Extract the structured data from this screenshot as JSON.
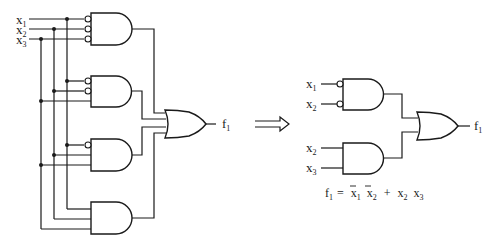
{
  "left_circuit": {
    "inputs": [
      {
        "name": "x",
        "sub": "1"
      },
      {
        "name": "x",
        "sub": "2"
      },
      {
        "name": "x",
        "sub": "3"
      }
    ],
    "gates": [
      {
        "type": "AND",
        "inputs": [
          "x1'",
          "x2'",
          "x3'"
        ]
      },
      {
        "type": "AND",
        "inputs": [
          "x1'",
          "x2'",
          "x3"
        ]
      },
      {
        "type": "AND",
        "inputs": [
          "x1'",
          "x2",
          "x3"
        ]
      },
      {
        "type": "AND",
        "inputs": [
          "x1",
          "x2",
          "x3"
        ]
      }
    ],
    "or_gate": {
      "type": "OR",
      "output": {
        "name": "f",
        "sub": "1"
      }
    }
  },
  "arrow": {
    "symbol": "⟹",
    "meaning": "simplifies-to"
  },
  "right_circuit": {
    "gate1_inputs": [
      {
        "name": "x",
        "sub": "1"
      },
      {
        "name": "x",
        "sub": "2"
      }
    ],
    "gate2_inputs": [
      {
        "name": "x",
        "sub": "2"
      },
      {
        "name": "x",
        "sub": "3"
      }
    ],
    "output": {
      "name": "f",
      "sub": "1"
    }
  },
  "equation": {
    "lhs": "f",
    "lhs_sub": "1",
    "equals": "=",
    "terms": [
      {
        "var": "x",
        "sub": "1",
        "bar": true
      },
      {
        "var": "x",
        "sub": "2",
        "bar": true
      },
      {
        "op": "+"
      },
      {
        "var": "x",
        "sub": "2",
        "bar": false
      },
      {
        "var": "x",
        "sub": "3",
        "bar": false
      }
    ],
    "text": "f1 = x̄1 x̄2 + x2 x3"
  }
}
